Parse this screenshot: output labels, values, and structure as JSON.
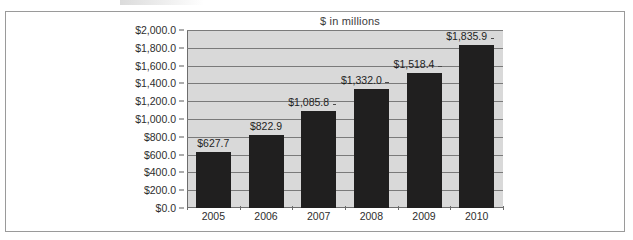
{
  "chart_data": {
    "type": "bar",
    "title": "$ in millions",
    "xlabel": "",
    "ylabel": "",
    "categories": [
      "2005",
      "2006",
      "2007",
      "2008",
      "2009",
      "2010"
    ],
    "values": [
      627.7,
      822.9,
      1085.8,
      1332.0,
      1518.4,
      1835.9
    ],
    "data_labels": [
      "$627.7",
      "$822.9",
      "$1,085.8",
      "$1,332.0",
      "$1,518.4",
      "$1,835.9"
    ],
    "ylim": [
      0,
      2000
    ],
    "ytick_values": [
      0,
      200,
      400,
      600,
      800,
      1000,
      1200,
      1400,
      1600,
      1800,
      2000
    ],
    "ytick_labels": [
      "$0.0",
      "$200.0",
      "$400.0",
      "$600.0",
      "$800.0",
      "$1,000.0",
      "$1,200.0",
      "$1,400.0",
      "$1,600.0",
      "$1,800.0",
      "$2,000.0"
    ],
    "grid": true,
    "legend": null,
    "colors": {
      "bar_fill": "#201f1f",
      "plot_background": "#d9d9d9",
      "gridline": "#7a7a7a",
      "axis": "#6d6d6d",
      "text": "#2e2e2e",
      "frame_border": "#9a9a9a",
      "page_background": "#ffffff"
    }
  }
}
